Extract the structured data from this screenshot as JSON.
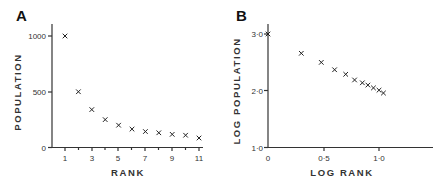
{
  "chart_data": [
    {
      "type": "scatter",
      "panel": "A",
      "title": "",
      "xlabel": "RANK",
      "ylabel": "POPULATION",
      "x_ticks": [
        "1",
        "3",
        "5",
        "7",
        "9",
        "11"
      ],
      "y_ticks": [
        "0",
        "500",
        "1000"
      ],
      "xlim": [
        0,
        11.3
      ],
      "ylim": [
        0,
        1000
      ],
      "grid": false,
      "marker": "x",
      "x": [
        1,
        2,
        3,
        4,
        5,
        6,
        7,
        8,
        9,
        10,
        11
      ],
      "y": [
        1000,
        500,
        340,
        250,
        200,
        165,
        143,
        132,
        118,
        110,
        85
      ]
    },
    {
      "type": "scatter",
      "panel": "B",
      "title": "",
      "xlabel": "LOG RANK",
      "ylabel": "LOG POPULATION",
      "x_ticks": [
        "0",
        "0·5",
        "1·0"
      ],
      "y_ticks": [
        "1·0",
        "2·0",
        "3·0"
      ],
      "xlim": [
        0,
        1.48
      ],
      "ylim": [
        1.0,
        3.0
      ],
      "grid": false,
      "marker": "x",
      "x": [
        0.0,
        0.3,
        0.48,
        0.6,
        0.7,
        0.78,
        0.85,
        0.9,
        0.95,
        1.0,
        1.04
      ],
      "y": [
        3.0,
        2.66,
        2.5,
        2.37,
        2.29,
        2.19,
        2.14,
        2.1,
        2.05,
        2.01,
        1.96
      ]
    }
  ],
  "panels": {
    "a": {
      "label": "A",
      "xlabel": "RANK",
      "ylabel": "POPULATION",
      "x_ticks": [
        "1",
        "3",
        "5",
        "7",
        "9",
        "11"
      ],
      "y_ticks": [
        "0",
        "500",
        "1000"
      ]
    },
    "b": {
      "label": "B",
      "xlabel": "LOG RANK",
      "ylabel": "LOG POPULATION",
      "x_ticks": [
        "0",
        "0·5",
        "1·0"
      ],
      "y_ticks": [
        "1·0",
        "2·0",
        "3·0"
      ]
    }
  }
}
